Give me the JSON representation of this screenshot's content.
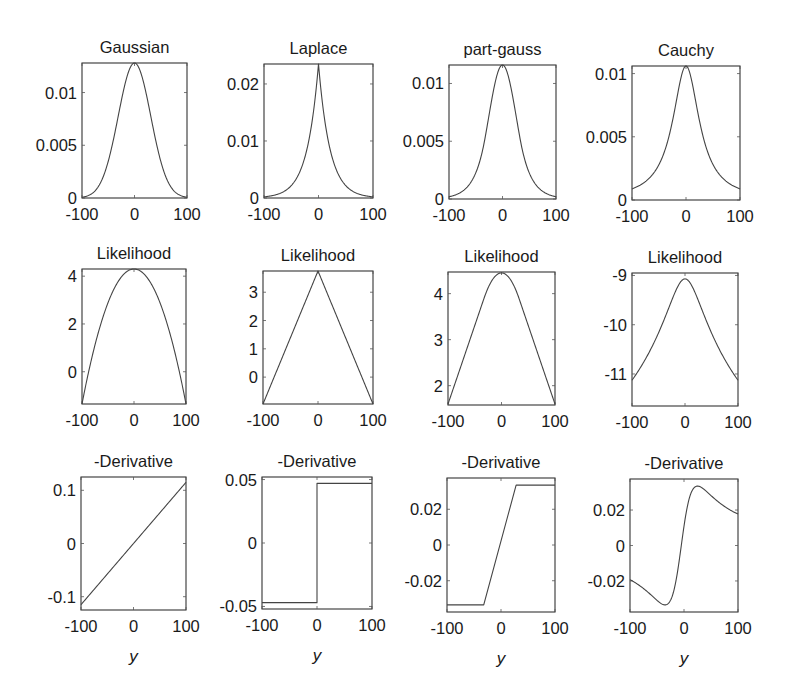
{
  "chart_data": [
    {
      "id": "gaussian-density",
      "type": "line",
      "title": "Gaussian",
      "xlabel": "",
      "ylabel": "",
      "xlim": [
        -100,
        100
      ],
      "ylim": [
        0,
        0.0128
      ],
      "xticks": [
        -100,
        0,
        100
      ],
      "xtick_labels": [
        "-100",
        "0",
        "100"
      ],
      "yticks": [
        0,
        0.005,
        0.01
      ],
      "ytick_labels": [
        "0",
        "0.005",
        "0.01"
      ],
      "function": "gaussian_pdf",
      "params": {
        "sigma": 31,
        "peak": 0.0128
      },
      "x": [
        -100,
        -75,
        -50,
        -25,
        0,
        25,
        50,
        75,
        100
      ],
      "y": [
        0.0002,
        0.0007,
        0.0035,
        0.0092,
        0.0128,
        0.0092,
        0.0035,
        0.0007,
        0.0002
      ]
    },
    {
      "id": "laplace-density",
      "type": "line",
      "title": "Laplace",
      "xlabel": "",
      "ylabel": "",
      "xlim": [
        -100,
        100
      ],
      "ylim": [
        0,
        0.0235
      ],
      "xticks": [
        -100,
        0,
        100
      ],
      "xtick_labels": [
        "-100",
        "0",
        "100"
      ],
      "yticks": [
        0,
        0.01,
        0.02
      ],
      "ytick_labels": [
        "0",
        "0.01",
        "0.02"
      ],
      "function": "laplace_pdf",
      "params": {
        "b": 21,
        "peak": 0.0235
      },
      "x": [
        -100,
        -75,
        -50,
        -25,
        0,
        25,
        50,
        75,
        100
      ],
      "y": [
        0.0005,
        0.0007,
        0.0022,
        0.0072,
        0.0235,
        0.0072,
        0.0022,
        0.0007,
        0.0005
      ]
    },
    {
      "id": "part-gauss-density",
      "type": "line",
      "title": "part-gauss",
      "xlabel": "",
      "ylabel": "",
      "xlim": [
        -100,
        100
      ],
      "ylim": [
        0,
        0.0116
      ],
      "xticks": [
        -100,
        0,
        100
      ],
      "xtick_labels": [
        "-100",
        "0",
        "100"
      ],
      "yticks": [
        0,
        0.005,
        0.01
      ],
      "ytick_labels": [
        "0",
        "0.005",
        "0.01"
      ],
      "function": "part_gauss_pdf",
      "params": {
        "sigma": 26,
        "knee": 33,
        "peak": 0.0116
      },
      "x": [
        -100,
        -75,
        -50,
        -25,
        0,
        25,
        50,
        75,
        100
      ],
      "y": [
        0.0008,
        0.0018,
        0.0039,
        0.0076,
        0.0116,
        0.0076,
        0.0039,
        0.0018,
        0.0008
      ]
    },
    {
      "id": "cauchy-density",
      "type": "line",
      "title": "Cauchy",
      "xlabel": "",
      "ylabel": "",
      "xlim": [
        -100,
        100
      ],
      "ylim": [
        0,
        0.0106
      ],
      "xticks": [
        -100,
        0,
        100
      ],
      "xtick_labels": [
        "-100",
        "0",
        "100"
      ],
      "yticks": [
        0,
        0.005,
        0.01
      ],
      "ytick_labels": [
        "0",
        "0.005",
        "0.01"
      ],
      "function": "cauchy_pdf",
      "params": {
        "gamma": 30,
        "peak": 0.0106
      },
      "x": [
        -100,
        -75,
        -50,
        -25,
        0,
        25,
        50,
        75,
        100
      ],
      "y": [
        0.0009,
        0.0014,
        0.0028,
        0.0063,
        0.0106,
        0.0063,
        0.0028,
        0.0014,
        0.0009
      ]
    },
    {
      "id": "gaussian-likelihood",
      "type": "line",
      "title": "Likelihood",
      "xlabel": "",
      "ylabel": "",
      "xlim": [
        -100,
        100
      ],
      "ylim": [
        -1.35,
        4.3
      ],
      "xticks": [
        -100,
        0,
        100
      ],
      "xtick_labels": [
        "-100",
        "0",
        "100"
      ],
      "yticks": [
        0,
        2,
        4
      ],
      "ytick_labels": [
        "0",
        "2",
        "4"
      ],
      "function": "parabola",
      "params": {
        "top": 4.3,
        "bottom": -1.35
      },
      "x": [
        -100,
        -50,
        0,
        50,
        100
      ],
      "y": [
        -1.35,
        2.89,
        4.3,
        2.89,
        -1.35
      ]
    },
    {
      "id": "laplace-likelihood",
      "type": "line",
      "title": "Likelihood",
      "xlabel": "",
      "ylabel": "",
      "xlim": [
        -100,
        100
      ],
      "ylim": [
        -0.95,
        3.75
      ],
      "xticks": [
        -100,
        0,
        100
      ],
      "xtick_labels": [
        "-100",
        "0",
        "100"
      ],
      "yticks": [
        0,
        1,
        2,
        3
      ],
      "ytick_labels": [
        "0",
        "1",
        "2",
        "3"
      ],
      "function": "vee",
      "params": {
        "top": 3.75,
        "bottom": -0.95
      },
      "x": [
        -100,
        0,
        100
      ],
      "y": [
        -0.95,
        3.75,
        -0.95
      ]
    },
    {
      "id": "part-gauss-likelihood",
      "type": "line",
      "title": "Likelihood",
      "xlabel": "",
      "ylabel": "",
      "xlim": [
        -100,
        100
      ],
      "ylim": [
        1.58,
        4.47
      ],
      "xticks": [
        -100,
        0,
        100
      ],
      "xtick_labels": [
        "-100",
        "0",
        "100"
      ],
      "yticks": [
        2,
        3,
        4
      ],
      "ytick_labels": [
        "2",
        "3",
        "4"
      ],
      "function": "huber",
      "params": {
        "top": 4.45,
        "bottom": 1.6,
        "knee": 33
      },
      "x": [
        -100,
        -33,
        0,
        33,
        100
      ],
      "y": [
        1.6,
        4.0,
        4.45,
        4.0,
        1.6
      ]
    },
    {
      "id": "cauchy-likelihood",
      "type": "line",
      "title": "Likelihood",
      "xlabel": "",
      "ylabel": "",
      "xlim": [
        -100,
        100
      ],
      "ylim": [
        -11.65,
        -8.95
      ],
      "xticks": [
        -100,
        0,
        100
      ],
      "xtick_labels": [
        "-100",
        "0",
        "100"
      ],
      "yticks": [
        -11,
        -10,
        -9
      ],
      "ytick_labels": [
        "-11",
        "-10",
        "-9"
      ],
      "function": "log_cauchy",
      "params": {
        "top": -9.07,
        "gamma": 30
      },
      "x": [
        -100,
        -50,
        0,
        50,
        100
      ],
      "y": [
        -11.5,
        -10.2,
        -9.07,
        -10.2,
        -11.5
      ]
    },
    {
      "id": "gaussian-derivative",
      "type": "line",
      "title": "-Derivative",
      "xlabel": "y",
      "ylabel": "",
      "xlim": [
        -100,
        100
      ],
      "ylim": [
        -0.125,
        0.125
      ],
      "xticks": [
        -100,
        0,
        100
      ],
      "xtick_labels": [
        "-100",
        "0",
        "100"
      ],
      "yticks": [
        -0.1,
        0,
        0.1
      ],
      "ytick_labels": [
        "-0.1",
        "0",
        "0.1"
      ],
      "function": "linear",
      "params": {
        "slope": 0.00115
      },
      "x": [
        -100,
        0,
        100
      ],
      "y": [
        -0.115,
        0,
        0.115
      ]
    },
    {
      "id": "laplace-derivative",
      "type": "line",
      "title": "-Derivative",
      "xlabel": "y",
      "ylabel": "",
      "xlim": [
        -100,
        100
      ],
      "ylim": [
        -0.052,
        0.052
      ],
      "xticks": [
        -100,
        0,
        100
      ],
      "xtick_labels": [
        "-100",
        "0",
        "100"
      ],
      "yticks": [
        -0.05,
        0,
        0.05
      ],
      "ytick_labels": [
        "-0.05",
        "0",
        "0.05"
      ],
      "function": "sign",
      "params": {
        "level": 0.047
      },
      "x": [
        -100,
        0,
        0,
        100
      ],
      "y": [
        -0.047,
        -0.047,
        0.047,
        0.047
      ]
    },
    {
      "id": "part-gauss-derivative",
      "type": "line",
      "title": "-Derivative",
      "xlabel": "y",
      "ylabel": "",
      "xlim": [
        -100,
        100
      ],
      "ylim": [
        -0.0375,
        0.0375
      ],
      "xticks": [
        -100,
        0,
        100
      ],
      "xtick_labels": [
        "-100",
        "0",
        "100"
      ],
      "yticks": [
        -0.02,
        0,
        0.02
      ],
      "ytick_labels": [
        "-0.02",
        "0",
        "0.02"
      ],
      "function": "clipped_linear",
      "params": {
        "level": 0.0335,
        "knee_left": -32,
        "knee_right": 28
      },
      "x": [
        -100,
        -32,
        28,
        100
      ],
      "y": [
        -0.0335,
        -0.0335,
        0.0335,
        0.0335
      ]
    },
    {
      "id": "cauchy-derivative",
      "type": "line",
      "title": "-Derivative",
      "xlabel": "y",
      "ylabel": "",
      "xlim": [
        -100,
        100
      ],
      "ylim": [
        -0.0375,
        0.0375
      ],
      "xticks": [
        -100,
        0,
        100
      ],
      "xtick_labels": [
        "-100",
        "0",
        "100"
      ],
      "yticks": [
        -0.02,
        0,
        0.02
      ],
      "ytick_labels": [
        "-0.02",
        "0",
        "0.02"
      ],
      "function": "cauchy_score",
      "params": {
        "gamma": 30,
        "offset": -5
      },
      "x": [
        -100,
        -30,
        0,
        30,
        100
      ],
      "y": [
        -0.019,
        -0.0335,
        0.0,
        0.0335,
        0.018
      ]
    }
  ]
}
